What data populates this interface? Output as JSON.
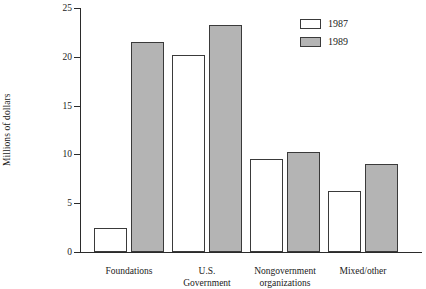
{
  "chart_data": {
    "type": "bar",
    "title": "",
    "subtitle": "",
    "xlabel": "",
    "ylabel": "Millions of dollars",
    "ylim": [
      0,
      25
    ],
    "yticks": [
      0,
      5,
      10,
      15,
      20,
      25
    ],
    "ytick_labels": [
      "0",
      "5",
      "10",
      "15",
      "20",
      "25"
    ],
    "grid": false,
    "legend_position": "top-right",
    "categories": [
      "Foundations",
      "U.S.\nGovernment",
      "Nongovernment\norganizations",
      "Mixed/other"
    ],
    "series": [
      {
        "name": "1987",
        "color": "#ffffff",
        "values": [
          2.5,
          20.2,
          9.5,
          6.3
        ]
      },
      {
        "name": "1989",
        "color": "#b4b4b4",
        "values": [
          21.5,
          23.3,
          10.2,
          9.0
        ]
      }
    ],
    "legend": [
      {
        "label": "1987",
        "swatch": "white"
      },
      {
        "label": "1989",
        "swatch": "gray"
      }
    ],
    "colors": {
      "series_1987": "#ffffff",
      "series_1989": "#b4b4b4",
      "axis": "#2b2b2b",
      "bar_outline": "#3a3a3a",
      "text": "#1a1a1a",
      "background": "#ffffff"
    }
  }
}
